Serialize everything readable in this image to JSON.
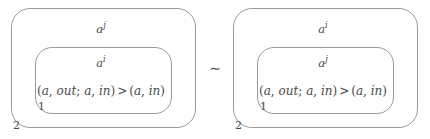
{
  "figure": {
    "width": 430,
    "height": 139,
    "background_color": "#ffffff",
    "stroke_color": "#9a9a9a",
    "text_color": "#4a4a4a"
  },
  "relation": {
    "symbol": "∼",
    "name": "equivalence-tilde"
  },
  "panels": [
    {
      "id": "left",
      "outer_box": {
        "label_base": "a",
        "label_sup": "j",
        "index": "2"
      },
      "inner_box": {
        "label_base": "a",
        "label_sup": "i",
        "index": "1",
        "formula": {
          "open_left": "(",
          "arg1": "a",
          "comma1": ", ",
          "arg2": "out",
          "semicolon": "; ",
          "arg3": "a",
          "comma2": ", ",
          "arg4": "in",
          "close_left": ")",
          "operator": ">",
          "open_right": "(",
          "arg5": "a",
          "comma3": ", ",
          "arg6": "in",
          "close_right": ")",
          "plain": "(a, out; a, in) > (a, in)"
        }
      }
    },
    {
      "id": "right",
      "outer_box": {
        "label_base": "a",
        "label_sup": "i",
        "index": "2"
      },
      "inner_box": {
        "label_base": "a",
        "label_sup": "j",
        "index": "1",
        "formula": {
          "open_left": "(",
          "arg1": "a",
          "comma1": ", ",
          "arg2": "out",
          "semicolon": "; ",
          "arg3": "a",
          "comma2": ", ",
          "arg4": "in",
          "close_left": ")",
          "operator": ">",
          "open_right": "(",
          "arg5": "a",
          "comma3": ", ",
          "arg6": "in",
          "close_right": ")",
          "plain": "(a, out; a, in) > (a, in)"
        }
      }
    }
  ]
}
